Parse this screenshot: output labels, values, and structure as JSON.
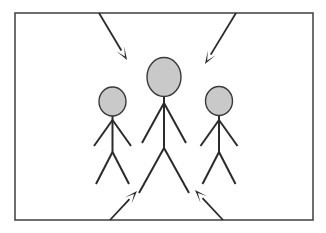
{
  "scene": {
    "title": "Stick figure group with converging arrows",
    "canvas_width": 326,
    "canvas_height": 233,
    "background_color": "#ffffff"
  },
  "frame": {
    "label": "picture-frame-border",
    "x": 15,
    "y": 13,
    "width": 298,
    "height": 207,
    "stroke_color": "#4a4a4a",
    "stroke_width": 1.6,
    "fill_color": "#ffffff"
  },
  "style": {
    "head_fill": "#c9c9c9",
    "head_stroke": "#3a3a3a",
    "head_stroke_width": 1.4,
    "limb_stroke": "#2b2b2b",
    "limb_stroke_width": 2.0,
    "arrow_stroke": "#2b2b2b",
    "arrow_stroke_width": 1.8
  },
  "figures": [
    {
      "name": "left-figure",
      "role": "small-left-person",
      "head": {
        "cx": 112.5,
        "cy": 101.5,
        "rx": 13.5,
        "ry": 14.5
      },
      "neck": {
        "x1": 112.5,
        "y1": 116,
        "x2": 112.5,
        "y2": 152
      },
      "arms": [
        {
          "x1": 112.5,
          "y1": 120,
          "x2": 94,
          "y2": 146
        },
        {
          "x1": 112.5,
          "y1": 120,
          "x2": 131,
          "y2": 146
        }
      ],
      "legs": [
        {
          "x1": 112.5,
          "y1": 152,
          "x2": 96,
          "y2": 184
        },
        {
          "x1": 112.5,
          "y1": 152,
          "x2": 129,
          "y2": 184
        }
      ]
    },
    {
      "name": "center-figure",
      "role": "large-center-person",
      "head": {
        "cx": 164,
        "cy": 77,
        "rx": 17,
        "ry": 19.5
      },
      "neck": {
        "x1": 164,
        "y1": 96.5,
        "x2": 164,
        "y2": 148
      },
      "arms": [
        {
          "x1": 164,
          "y1": 103,
          "x2": 142,
          "y2": 143
        },
        {
          "x1": 164,
          "y1": 103,
          "x2": 186,
          "y2": 143
        }
      ],
      "legs": [
        {
          "x1": 164,
          "y1": 148,
          "x2": 139,
          "y2": 193
        },
        {
          "x1": 164,
          "y1": 148,
          "x2": 189,
          "y2": 193
        }
      ]
    },
    {
      "name": "right-figure",
      "role": "small-right-person",
      "head": {
        "cx": 219,
        "cy": 101,
        "rx": 13.5,
        "ry": 14.5
      },
      "neck": {
        "x1": 219,
        "y1": 115.5,
        "x2": 219,
        "y2": 152
      },
      "arms": [
        {
          "x1": 219,
          "y1": 120,
          "x2": 200.5,
          "y2": 146
        },
        {
          "x1": 219,
          "y1": 120,
          "x2": 237.5,
          "y2": 146
        }
      ],
      "legs": [
        {
          "x1": 219,
          "y1": 152,
          "x2": 202.5,
          "y2": 184
        },
        {
          "x1": 219,
          "y1": 152,
          "x2": 235.5,
          "y2": 184
        }
      ]
    }
  ],
  "arrows": [
    {
      "name": "arrow-top-left",
      "direction": "down-right",
      "tail": {
        "x": 99,
        "y": 13
      },
      "tip": {
        "x": 127,
        "y": 60
      }
    },
    {
      "name": "arrow-top-right",
      "direction": "down-left",
      "tail": {
        "x": 236,
        "y": 13
      },
      "tip": {
        "x": 205,
        "y": 64
      }
    },
    {
      "name": "arrow-bottom-left",
      "direction": "up-right",
      "tail": {
        "x": 110,
        "y": 220
      },
      "tip": {
        "x": 137,
        "y": 191
      }
    },
    {
      "name": "arrow-bottom-right",
      "direction": "up-left",
      "tail": {
        "x": 223,
        "y": 220
      },
      "tip": {
        "x": 195,
        "y": 190
      }
    }
  ]
}
